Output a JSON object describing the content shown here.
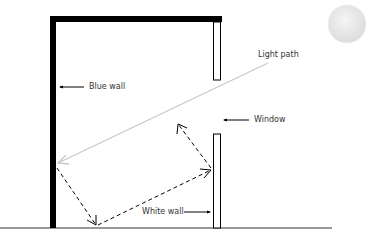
{
  "diagram": {
    "type": "light reflection room diagram",
    "labels": {
      "light_path": "Light path",
      "blue_wall": "Blue wall",
      "window": "Window",
      "white_wall": "White wall"
    },
    "elements": {
      "sun": "sun-circle",
      "walls": [
        "top wall",
        "left wall (blue)",
        "window upper pane",
        "window lower pane (white wall)"
      ],
      "ground": "ground line"
    },
    "colors": {
      "wall": "#000000",
      "light_path": "#cccccc",
      "reflection": "#000000",
      "sun": "#e6e6e6",
      "text": "#333333"
    }
  }
}
